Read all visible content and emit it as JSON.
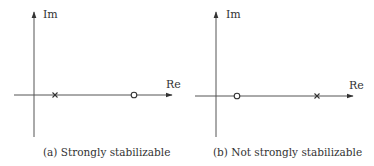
{
  "figure": {
    "panels": [
      {
        "id": "a",
        "caption": "(a) Strongly stabilizable",
        "axes": {
          "x_label": "Re",
          "y_label": "Im"
        },
        "markers": [
          {
            "type": "pole",
            "symbol": "×",
            "position": "near origin on positive real axis"
          },
          {
            "type": "zero",
            "symbol": "○",
            "position": "far right on positive real axis"
          }
        ]
      },
      {
        "id": "b",
        "caption": "(b) Not strongly stabilizable",
        "axes": {
          "x_label": "Re",
          "y_label": "Im"
        },
        "markers": [
          {
            "type": "zero",
            "symbol": "○",
            "position": "near origin on positive real axis"
          },
          {
            "type": "pole",
            "symbol": "×",
            "position": "far right on positive real axis"
          }
        ]
      }
    ]
  }
}
